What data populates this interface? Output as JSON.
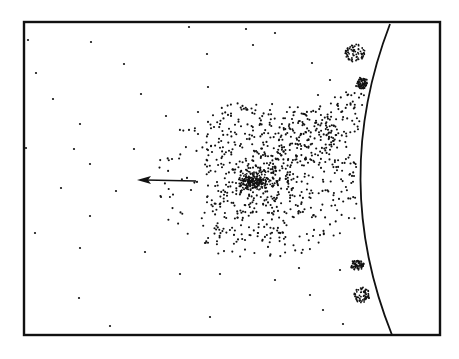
{
  "figure": {
    "colors": {
      "ink": "#111111",
      "background": "#ffffff"
    },
    "frame": {
      "x1": 24,
      "y1": 22,
      "x2": 440,
      "y2": 335
    },
    "surface_curve": {
      "top": [
        390,
        24
      ],
      "control": [
        330,
        180
      ],
      "bottom": [
        392,
        335
      ]
    },
    "arrow": {
      "from": [
        196,
        181
      ],
      "to": [
        137,
        180
      ],
      "direction": "left"
    },
    "cluster": {
      "center": [
        250,
        181
      ],
      "label": "dense-particle-cloud"
    },
    "clumps": [
      {
        "cx": 355,
        "cy": 53,
        "rx": 10,
        "ry": 9
      },
      {
        "cx": 362,
        "cy": 83,
        "rx": 5,
        "ry": 6
      },
      {
        "cx": 357,
        "cy": 265,
        "rx": 7,
        "ry": 5
      },
      {
        "cx": 362,
        "cy": 295,
        "rx": 8,
        "ry": 8
      }
    ],
    "sparse_dots": [
      [
        28,
        40
      ],
      [
        91,
        42
      ],
      [
        189,
        27
      ],
      [
        124,
        64
      ],
      [
        36,
        73
      ],
      [
        207,
        54
      ],
      [
        53,
        99
      ],
      [
        141,
        94
      ],
      [
        208,
        87
      ],
      [
        166,
        116
      ],
      [
        80,
        124
      ],
      [
        198,
        112
      ],
      [
        214,
        127
      ],
      [
        26,
        148
      ],
      [
        74,
        149
      ],
      [
        134,
        149
      ],
      [
        198,
        134
      ],
      [
        212,
        152
      ],
      [
        90,
        164
      ],
      [
        172,
        159
      ],
      [
        61,
        188
      ],
      [
        116,
        191
      ],
      [
        161,
        197
      ],
      [
        191,
        190
      ],
      [
        35,
        233
      ],
      [
        80,
        248
      ],
      [
        145,
        252
      ],
      [
        205,
        243
      ],
      [
        79,
        298
      ],
      [
        110,
        326
      ],
      [
        180,
        274
      ],
      [
        220,
        274
      ],
      [
        210,
        317
      ],
      [
        90,
        216
      ],
      [
        246,
        29
      ],
      [
        275,
        33
      ],
      [
        312,
        63
      ],
      [
        330,
        80
      ],
      [
        318,
        95
      ],
      [
        253,
        45
      ],
      [
        292,
        119
      ],
      [
        270,
        110
      ],
      [
        264,
        170
      ],
      [
        245,
        240
      ],
      [
        310,
        295
      ],
      [
        343,
        324
      ],
      [
        323,
        310
      ],
      [
        299,
        268
      ],
      [
        275,
        280
      ],
      [
        340,
        270
      ]
    ]
  }
}
